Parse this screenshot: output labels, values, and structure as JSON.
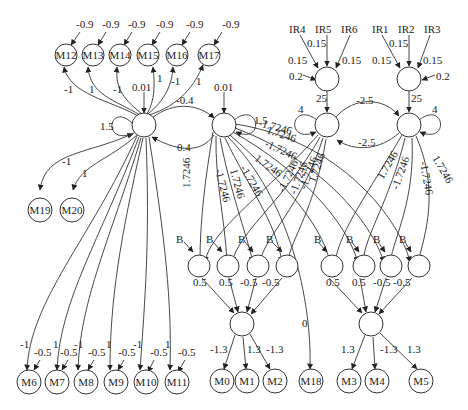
{
  "diagram": {
    "title": "",
    "nodes": {
      "M12": "M12",
      "M13": "M13",
      "M14": "M14",
      "M15": "M15",
      "M16": "M16",
      "M17": "M17",
      "M19": "M19",
      "M20": "M20",
      "M6": "M6",
      "M7": "M7",
      "M8": "M8",
      "M9": "M9",
      "M10": "M10",
      "M11": "M11",
      "M0": "M0",
      "M1": "M1",
      "M2": "M2",
      "M18": "M18",
      "M3": "M3",
      "M4": "M4",
      "M5": "M5",
      "IR1": "IR1",
      "IR2": "IR2",
      "IR3": "IR3",
      "IR4": "IR4",
      "IR5": "IR5",
      "IR6": "IR6"
    },
    "labels": {
      "m_bias": "-0.9",
      "a_to_m12": "-1",
      "a_to_m13": "1",
      "a_to_m14": "-1",
      "a_to_m15": "1",
      "a_to_m16": "-1",
      "a_to_m17": "1",
      "a_bias": "0.01",
      "b_bias": "0.01",
      "a_self": "1.5",
      "b_self": "1.5",
      "a_to_b": "-0.4",
      "b_to_a": "0.4",
      "a_to_m19": "-1",
      "a_to_m20": "1",
      "c_self": "4",
      "d_self": "4",
      "c_to_d": "-2.5",
      "d_to_c": "-2.5",
      "ir_in_to_c": "25",
      "ir_in_to_d": "25",
      "ir_w": "0.15",
      "ir_bias": "0.2",
      "w_pos": "1.7246",
      "w_neg": "-1.7246",
      "B": "B",
      "h_w1": "0.5",
      "h_w2": "0.5",
      "h_w3": "-0.5",
      "h_w4": "-0.5",
      "o_m0": "-1.3",
      "o_m1": "1.3",
      "o_m2": "-1.3",
      "o_m3": "1.3",
      "o_m4": "-1.3",
      "o_m5": "1.3",
      "m18_w": "0",
      "bottom_a_w": [
        "-1",
        "1",
        "-1",
        "1",
        "-1",
        "1"
      ],
      "bottom_bias": "-0.5"
    }
  }
}
